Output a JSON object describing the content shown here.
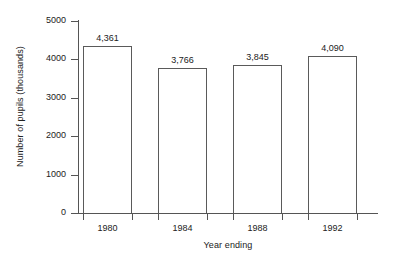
{
  "chart_data": {
    "type": "bar",
    "title": "",
    "subtitle": "",
    "xlabel": "Year ending",
    "ylabel": "Number of pupils (thousands)",
    "categories": [
      "1980",
      "1984",
      "1988",
      "1992"
    ],
    "values": [
      4361,
      3766,
      3845,
      4090
    ],
    "value_labels": [
      "4,361",
      "3,766",
      "3,845",
      "4,090"
    ],
    "ylim": [
      0,
      5000
    ],
    "ytick_labels": [
      "0",
      "1000",
      "2000",
      "3000",
      "4000",
      "5000"
    ],
    "ytick_values": [
      0,
      1000,
      2000,
      3000,
      4000,
      5000
    ],
    "grid": false,
    "legend": null,
    "legend_position": "none",
    "bar_fill_color": "#ffffff",
    "bar_edge_color": "#5a5a5a",
    "axis_color": "#555555",
    "text_color": "#222222",
    "background_color": "#ffffff"
  }
}
